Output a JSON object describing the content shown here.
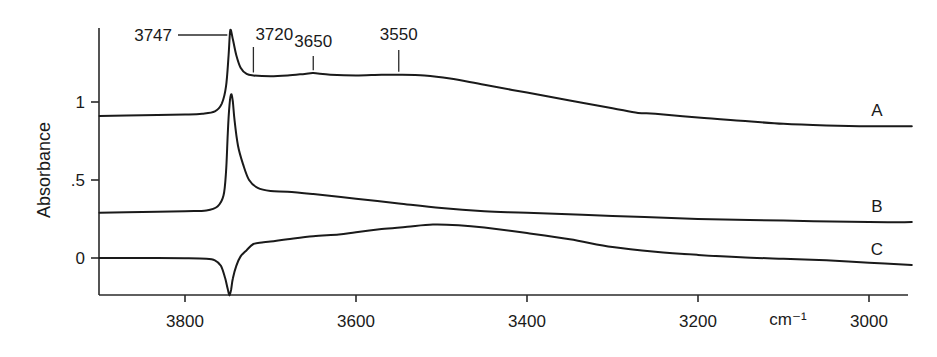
{
  "chart_data": {
    "type": "line",
    "title": "",
    "xlabel": "cm⁻¹",
    "ylabel": "Absorbance",
    "xlim": [
      3900,
      2950
    ],
    "ylim": [
      -0.24,
      1.55
    ],
    "x_reversed": true,
    "grid": false,
    "legend": "inline labels at right end of curves",
    "x_ticks": [
      3800,
      3600,
      3400,
      3200,
      3000
    ],
    "x_tick_labels": [
      "3800",
      "3600",
      "3400",
      "3200",
      "3000"
    ],
    "y_ticks": [
      0,
      0.5,
      1
    ],
    "y_tick_labels": [
      "0",
      ".5",
      "1"
    ],
    "annotations": [
      {
        "label": "3747",
        "x": 3747,
        "style": "leader-left"
      },
      {
        "label": "3720",
        "x": 3720,
        "style": "vertical"
      },
      {
        "label": "3650",
        "x": 3650,
        "style": "vertical"
      },
      {
        "label": "3550",
        "x": 3550,
        "style": "vertical"
      }
    ],
    "series": [
      {
        "name": "A",
        "x": [
          3900,
          3850,
          3800,
          3780,
          3765,
          3757,
          3752,
          3749,
          3747,
          3744,
          3740,
          3735,
          3728,
          3720,
          3700,
          3680,
          3660,
          3650,
          3630,
          3600,
          3570,
          3550,
          3520,
          3490,
          3450,
          3400,
          3350,
          3300,
          3270,
          3250,
          3200,
          3150,
          3100,
          3050,
          3000,
          2950
        ],
        "values": [
          0.91,
          0.915,
          0.92,
          0.925,
          0.94,
          0.99,
          1.1,
          1.3,
          1.46,
          1.4,
          1.3,
          1.22,
          1.18,
          1.17,
          1.165,
          1.17,
          1.18,
          1.185,
          1.175,
          1.17,
          1.175,
          1.175,
          1.17,
          1.15,
          1.11,
          1.06,
          1.01,
          0.96,
          0.93,
          0.925,
          0.9,
          0.88,
          0.86,
          0.85,
          0.845,
          0.845
        ]
      },
      {
        "name": "B",
        "x": [
          3900,
          3850,
          3800,
          3775,
          3762,
          3755,
          3752,
          3750,
          3748,
          3746,
          3744,
          3742,
          3738,
          3732,
          3725,
          3715,
          3700,
          3680,
          3650,
          3600,
          3550,
          3500,
          3450,
          3400,
          3300,
          3200,
          3100,
          3000,
          2950
        ],
        "values": [
          0.29,
          0.295,
          0.3,
          0.305,
          0.33,
          0.4,
          0.55,
          0.8,
          0.98,
          1.05,
          1.0,
          0.88,
          0.72,
          0.6,
          0.5,
          0.45,
          0.43,
          0.425,
          0.41,
          0.38,
          0.35,
          0.32,
          0.3,
          0.29,
          0.27,
          0.25,
          0.24,
          0.23,
          0.23
        ]
      },
      {
        "name": "C",
        "x": [
          3900,
          3850,
          3800,
          3775,
          3765,
          3758,
          3753,
          3750,
          3748,
          3746,
          3744,
          3740,
          3735,
          3728,
          3720,
          3710,
          3700,
          3680,
          3650,
          3620,
          3600,
          3570,
          3540,
          3510,
          3480,
          3450,
          3400,
          3350,
          3300,
          3250,
          3200,
          3150,
          3100,
          3050,
          3000,
          2950
        ],
        "values": [
          0.0,
          0.0,
          -0.002,
          -0.005,
          -0.015,
          -0.05,
          -0.13,
          -0.2,
          -0.24,
          -0.2,
          -0.13,
          -0.05,
          0.01,
          0.05,
          0.09,
          0.1,
          0.105,
          0.12,
          0.14,
          0.15,
          0.165,
          0.185,
          0.2,
          0.215,
          0.21,
          0.195,
          0.16,
          0.12,
          0.07,
          0.04,
          0.02,
          0.005,
          -0.005,
          -0.015,
          -0.03,
          -0.045
        ]
      }
    ]
  }
}
